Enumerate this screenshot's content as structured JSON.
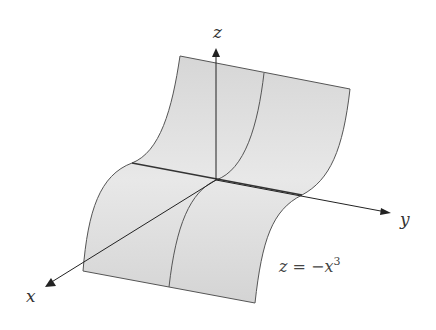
{
  "figure": {
    "axes": {
      "x_label": "x",
      "y_label": "y",
      "z_label": "z"
    },
    "equation": {
      "lhs": "z",
      "eq": "=",
      "rhs_prefix": "−x",
      "exponent": "3"
    },
    "colors": {
      "surface_fill": "#dcdcdc",
      "surface_edge": "#555555",
      "axis": "#222222"
    }
  }
}
